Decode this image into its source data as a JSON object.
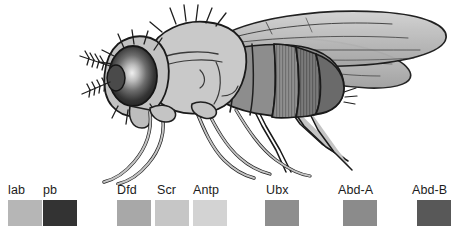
{
  "figure": {
    "organism": "drosophila-melanogaster-fruit-fly",
    "view": "lateral",
    "style": "grayscale-line-illustration",
    "parts": {
      "eye": "compound-eye",
      "antenna": "branched-arista",
      "head": "head",
      "thorax": "thorax",
      "abdomen": "segmented-abdomen",
      "wings": "pair-of-wings",
      "legs": "six-legs"
    },
    "colors": {
      "outline": "#1a1a1a",
      "body_light": "#c9c9c9",
      "body_mid": "#a0a0a0",
      "body_dark": "#6e6e6e",
      "eye_dark": "#2a2a2a",
      "eye_highlight": "#e8e8e8",
      "wing": "#bdbdbd",
      "background": "#ffffff"
    }
  },
  "legend": {
    "title": "Hox gene expression domains",
    "genes": [
      {
        "label": "lab",
        "color": "#b6b6b6",
        "x": 8,
        "label_x": 8,
        "swatch_x": 8
      },
      {
        "label": "pb",
        "color": "#333333",
        "x": 45,
        "label_x": 45,
        "swatch_x": 43
      },
      {
        "label": "Dfd",
        "color": "#a8a8a8",
        "x": 118,
        "label_x": 118,
        "swatch_x": 117
      },
      {
        "label": "Scr",
        "color": "#c6c6c6",
        "x": 156,
        "label_x": 158,
        "swatch_x": 155
      },
      {
        "label": "Antp",
        "color": "#d3d3d3",
        "x": 193,
        "label_x": 192,
        "swatch_x": 193
      },
      {
        "label": "Ubx",
        "color": "#8e8e8e",
        "x": 266,
        "label_x": 267,
        "swatch_x": 265
      },
      {
        "label": "Abd-A",
        "color": "#8b8b8b",
        "x": 340,
        "label_x": 338,
        "swatch_x": 343
      },
      {
        "label": "Abd-B",
        "color": "#585858",
        "x": 414,
        "label_x": 412,
        "swatch_x": 417
      }
    ]
  }
}
